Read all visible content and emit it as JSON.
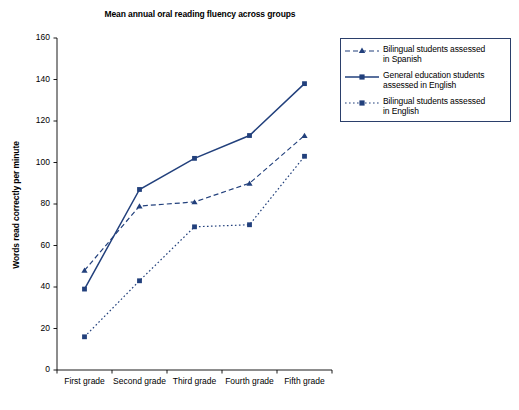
{
  "chart_data": {
    "type": "line",
    "title": "Mean annual oral reading fluency across groups",
    "xlabel": "",
    "ylabel": "Words read correctly per minute",
    "categories": [
      "First grade",
      "Second grade",
      "Third grade",
      "Fourth grade",
      "Fifth grade"
    ],
    "ylim": [
      0,
      160
    ],
    "yticks": [
      0,
      20,
      40,
      60,
      80,
      100,
      120,
      140,
      160
    ],
    "grid": false,
    "legend_position": "right",
    "accent_color": "#22407c",
    "series": [
      {
        "name": "Bilingual students assessed in Spanish",
        "linestyle": "dashed",
        "marker": "triangle",
        "color": "#22407c",
        "values": [
          48,
          79,
          81,
          90,
          113
        ]
      },
      {
        "name": "General education students assessed in English",
        "linestyle": "solid",
        "marker": "square",
        "color": "#22407c",
        "values": [
          39,
          87,
          102,
          113,
          138
        ]
      },
      {
        "name": "Bilingual students assessed in English",
        "linestyle": "dotted",
        "marker": "square",
        "color": "#22407c",
        "values": [
          16,
          43,
          69,
          70,
          103
        ]
      }
    ]
  },
  "legend": {
    "items": [
      {
        "label_line1": "Bilingual students assessed",
        "label_line2": "in Spanish"
      },
      {
        "label_line1": "General education students",
        "label_line2": "assessed in English"
      },
      {
        "label_line1": "Bilingual students assessed",
        "label_line2": "in English"
      }
    ]
  },
  "axis": {
    "ytick_labels": [
      "0",
      "20",
      "40",
      "60",
      "80",
      "100",
      "120",
      "140",
      "160"
    ]
  }
}
